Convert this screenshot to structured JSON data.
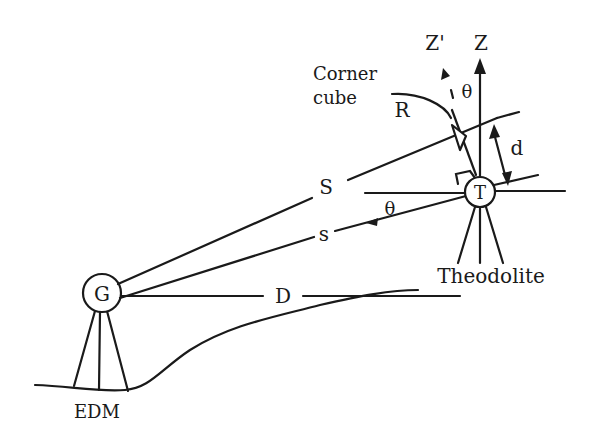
{
  "diagram": {
    "labels": {
      "z_prime": "Z'",
      "z": "Z",
      "corner_cube_line1": "Corner",
      "corner_cube_line2": "cube",
      "r": "R",
      "theta_top": "θ",
      "d": "d",
      "s_upper": "S",
      "s_lower": "s",
      "theta_mid": "θ",
      "t": "T",
      "theodolite": "Theodolite",
      "g": "G",
      "d_horizontal": "D",
      "edm": "EDM"
    },
    "colors": {
      "ink": "#1a1a1a",
      "background": "#ffffff"
    }
  }
}
